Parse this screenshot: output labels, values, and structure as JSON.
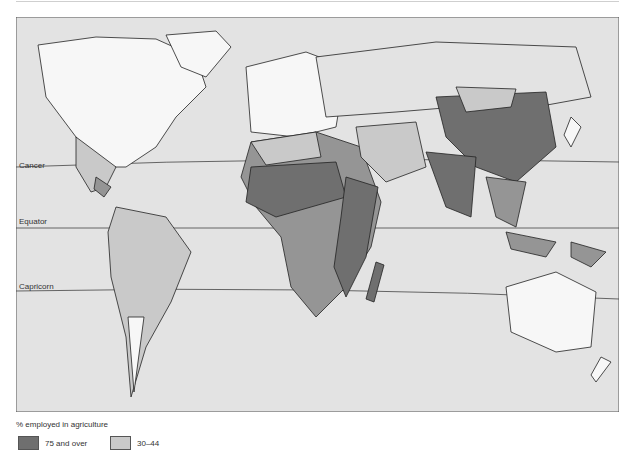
{
  "map": {
    "lines": {
      "cancer": "Cancer",
      "equator": "Equator",
      "capricorn": "Capricorn"
    },
    "colors": {
      "ocean": "#e3e3e3",
      "c75": "#6f6f6f",
      "c45": "#959595",
      "c30": "#c9c9c9",
      "low": "#f7f7f7",
      "border": "#222222"
    }
  },
  "legend": {
    "title": "% employed in agriculture",
    "items": [
      {
        "label": "75 and over",
        "color": "#6f6f6f"
      },
      {
        "label": "30–44",
        "color": "#c9c9c9"
      }
    ]
  }
}
